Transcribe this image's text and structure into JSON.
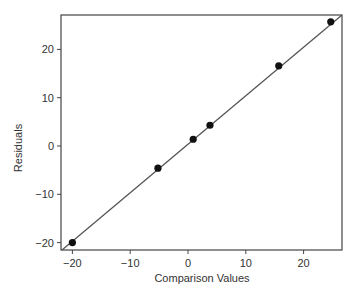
{
  "chart_data": {
    "type": "scatter",
    "title": "",
    "xlabel": "Comparison Values",
    "ylabel": "Residuals",
    "xlim": [
      -22,
      27
    ],
    "ylim": [
      -22,
      27
    ],
    "xticks": [
      -20,
      -10,
      0,
      10,
      20
    ],
    "yticks": [
      -20,
      -10,
      0,
      10,
      20
    ],
    "xtick_labels": [
      "−20",
      "−10",
      "0",
      "10",
      "20"
    ],
    "ytick_labels": [
      "−20",
      "−10",
      "0",
      "10",
      "20"
    ],
    "grid": false,
    "legend": null,
    "series": [
      {
        "name": "points",
        "x": [
          -20,
          -5.2,
          0.9,
          3.8,
          15.7,
          24.7
        ],
        "y": [
          -20,
          -4.6,
          1.4,
          4.3,
          16.6,
          25.7
        ]
      }
    ],
    "reference_line": {
      "type": "identity",
      "from": [
        -22,
        -22
      ],
      "to": [
        27,
        27
      ]
    },
    "colors": {
      "points": "#111111",
      "line": "#555555",
      "axis": "#444444"
    }
  }
}
